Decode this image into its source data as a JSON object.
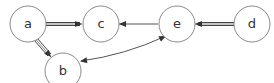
{
  "diagram": {
    "type": "directed-graph",
    "nodes": [
      {
        "id": "a",
        "label": "a"
      },
      {
        "id": "b",
        "label": "b"
      },
      {
        "id": "c",
        "label": "c"
      },
      {
        "id": "d",
        "label": "d"
      },
      {
        "id": "e",
        "label": "e"
      }
    ],
    "edges": [
      {
        "from": "a",
        "to": "c",
        "style": "double"
      },
      {
        "from": "a",
        "to": "b",
        "style": "double"
      },
      {
        "from": "e",
        "to": "c",
        "style": "single"
      },
      {
        "from": "d",
        "to": "e",
        "style": "double"
      },
      {
        "from": "b",
        "to": "e",
        "style": "bidirectional-curved"
      }
    ]
  }
}
